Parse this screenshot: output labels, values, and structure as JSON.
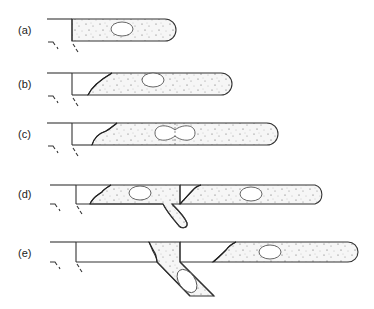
{
  "figure": {
    "panels": [
      {
        "id": "a",
        "label": "(a)"
      },
      {
        "id": "b",
        "label": "(b)"
      },
      {
        "id": "c",
        "label": "(c)",
        "cell_shape": "dividing (dumbbell)"
      },
      {
        "id": "d",
        "label": "(d)",
        "branch": "short closed side branch"
      },
      {
        "id": "e",
        "label": "(e)",
        "branch": "open diagonal channel"
      }
    ]
  }
}
